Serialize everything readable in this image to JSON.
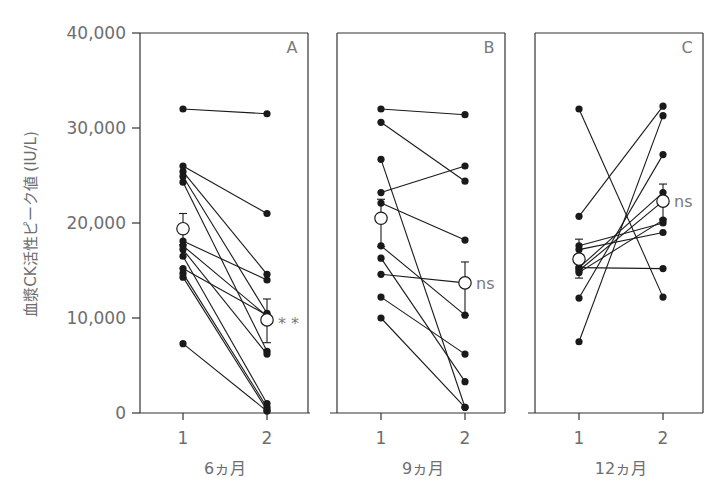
{
  "chart_data": {
    "type": "line",
    "title": "",
    "ylabel": "血漿CK活性ピーク値 (IU/L)",
    "ylim": [
      0,
      40000
    ],
    "yticks": [
      0,
      10000,
      20000,
      30000,
      40000
    ],
    "ytick_labels": [
      "0",
      "10,000",
      "20,000",
      "30,000",
      "40,000"
    ],
    "grid": false,
    "legend": null,
    "panels": [
      {
        "letter": "A",
        "xlabel": "6ヵ月",
        "x_ticks": [
          "1",
          "2"
        ],
        "significance": "**",
        "mean": {
          "x1": 19400,
          "x2": 9800,
          "err1": [
            17700,
            21000
          ],
          "err2": [
            7400,
            12000
          ]
        },
        "subjects": [
          [
            32000,
            31500
          ],
          [
            26000,
            21000
          ],
          [
            25400,
            14600
          ],
          [
            24900,
            10500
          ],
          [
            24300,
            6500
          ],
          [
            18100,
            14000
          ],
          [
            17600,
            10200
          ],
          [
            17200,
            6200
          ],
          [
            16500,
            1000
          ],
          [
            15200,
            10300
          ],
          [
            14700,
            600
          ],
          [
            14300,
            300
          ],
          [
            7300,
            200
          ]
        ]
      },
      {
        "letter": "B",
        "xlabel": "9ヵ月",
        "x_ticks": [
          "1",
          "2"
        ],
        "significance": "ns",
        "mean": {
          "x1": 20500,
          "x2": 13700,
          "err1": [
            17500,
            22500
          ],
          "err2": [
            10300,
            15900
          ]
        },
        "subjects": [
          [
            32000,
            31400
          ],
          [
            30600,
            24400
          ],
          [
            26700,
            600
          ],
          [
            23200,
            26000
          ],
          [
            22100,
            18200
          ],
          [
            17600,
            10300
          ],
          [
            16300,
            3300
          ],
          [
            14600,
            13700
          ],
          [
            12200,
            6200
          ],
          [
            10000,
            600
          ]
        ]
      },
      {
        "letter": "C",
        "xlabel": "12ヵ月",
        "x_ticks": [
          "1",
          "2"
        ],
        "significance": "ns",
        "mean": {
          "x1": 16200,
          "x2": 22300,
          "err1": [
            14200,
            18300
          ],
          "err2": [
            20400,
            24100
          ]
        },
        "subjects": [
          [
            32000,
            12200
          ],
          [
            20700,
            32300
          ],
          [
            17600,
            20000
          ],
          [
            15300,
            23200
          ],
          [
            15300,
            15200
          ],
          [
            14800,
            20300
          ],
          [
            12100,
            27200
          ],
          [
            7500,
            31300
          ],
          [
            17200,
            19000
          ],
          [
            15000,
            22300
          ]
        ]
      }
    ]
  },
  "colors": {
    "line": "#1a1a1a",
    "axis": "#333333",
    "text": "#6e6e6e",
    "background": "#ffffff"
  }
}
